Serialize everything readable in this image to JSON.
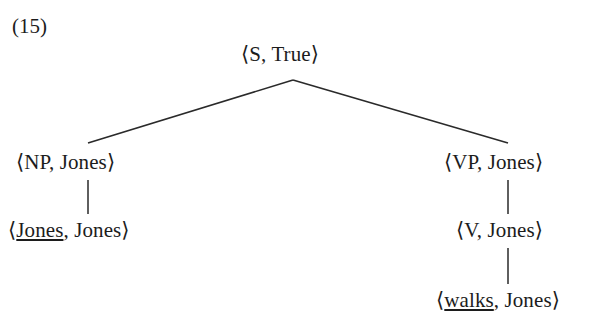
{
  "figure": {
    "example_number": "(15)",
    "type": "syntax-tree",
    "ink_color": "#1c1c1c",
    "background_color": "#ffffff"
  },
  "tree": {
    "root": {
      "id": "root",
      "open_bracket": "⟨",
      "category": "S",
      "separator": ", ",
      "value": "True",
      "close_bracket": "⟩",
      "full_text": "⟨S, True⟩",
      "underlined_part": ""
    },
    "nodes": [
      {
        "id": "np",
        "open_bracket": "⟨",
        "category": "NP",
        "separator": ", ",
        "value": "Jones",
        "close_bracket": "⟩",
        "full_text": "⟨NP, Jones⟩",
        "underlined_part": ""
      },
      {
        "id": "np-leaf",
        "open_bracket": "⟨",
        "category": "Jones",
        "separator": ", ",
        "value": "Jones",
        "close_bracket": "⟩",
        "full_text": "⟨Jones, Jones⟩",
        "underlined_part": "Jones"
      },
      {
        "id": "vp",
        "open_bracket": "⟨",
        "category": "VP",
        "separator": ", ",
        "value": "Jones",
        "close_bracket": "⟩",
        "full_text": "⟨VP, Jones⟩",
        "underlined_part": ""
      },
      {
        "id": "v",
        "open_bracket": "⟨",
        "category": "V",
        "separator": ", ",
        "value": "Jones",
        "close_bracket": "⟩",
        "full_text": "⟨V, Jones⟩",
        "underlined_part": ""
      },
      {
        "id": "v-leaf",
        "open_bracket": "⟨",
        "category": "walks",
        "separator": ", ",
        "value": "Jones",
        "close_bracket": "⟩",
        "full_text": "⟨walks, Jones⟩",
        "underlined_part": "walks"
      }
    ],
    "edges": [
      {
        "id": "root-to-np",
        "from": "root",
        "to": "np",
        "x1": 293,
        "y1": 80,
        "x2": 88,
        "y2": 143
      },
      {
        "id": "root-to-vp",
        "from": "root",
        "to": "vp",
        "x1": 293,
        "y1": 80,
        "x2": 508,
        "y2": 143
      },
      {
        "id": "np-to-leaf",
        "from": "np",
        "to": "np-leaf",
        "x1": 88,
        "y1": 180,
        "x2": 88,
        "y2": 214
      },
      {
        "id": "vp-to-v",
        "from": "vp",
        "to": "v",
        "x1": 508,
        "y1": 180,
        "x2": 508,
        "y2": 214
      },
      {
        "id": "v-to-leaf",
        "from": "v",
        "to": "v-leaf",
        "x1": 508,
        "y1": 248,
        "x2": 508,
        "y2": 284
      }
    ]
  }
}
